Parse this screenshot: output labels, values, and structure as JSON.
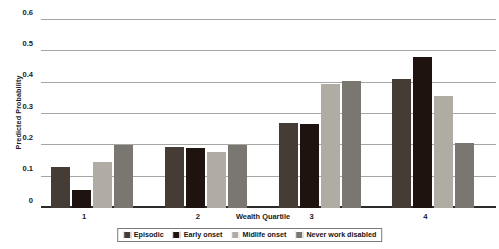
{
  "chart_data": {
    "type": "bar",
    "title": "",
    "xlabel": "Wealth Quartile",
    "ylabel": "Predicted Probability",
    "categories": [
      "1",
      "2",
      "3",
      "4"
    ],
    "ylim": [
      0,
      0.6
    ],
    "yticks": [
      "0",
      "0.1",
      "0.2",
      "0.3",
      "0.4",
      "0.5",
      "0.6"
    ],
    "ytick_values": [
      0,
      0.1,
      0.2,
      0.3,
      0.4,
      0.5,
      0.6
    ],
    "grid": true,
    "legend_position": "bottom",
    "series": [
      {
        "name": "Episodic",
        "color": "#463c36",
        "values": [
          0.13,
          0.195,
          0.272,
          0.411
        ]
      },
      {
        "name": "Early onset",
        "color": "#1f1310",
        "values": [
          0.058,
          0.19,
          0.268,
          0.481
        ]
      },
      {
        "name": "Midlife onset",
        "color": "#b0aca3",
        "values": [
          0.147,
          0.179,
          0.396,
          0.357
        ]
      },
      {
        "name": "Never work disabled",
        "color": "#7a7770",
        "values": [
          0.201,
          0.202,
          0.405,
          0.206
        ]
      }
    ]
  }
}
